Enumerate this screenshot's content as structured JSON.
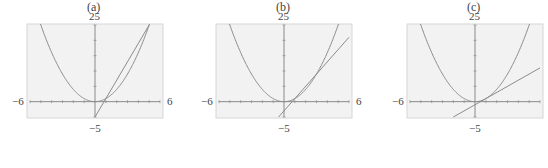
{
  "chart_data": [
    {
      "type": "line",
      "caption": "(a)",
      "xlim": [
        -6,
        6
      ],
      "ylim": [
        -5,
        25
      ],
      "tick_labels": {
        "x_min": "−6",
        "x_max": "6",
        "y_max": "25",
        "y_min": "−5"
      },
      "x_ticks_step": 1,
      "y_ticks_step": 5,
      "series": [
        {
          "name": "curve",
          "expr": "y = x^2"
        },
        {
          "name": "secant line",
          "expr": "y = 6x − 5",
          "points": [
            [
              0,
              -5
            ],
            [
              5,
              25
            ]
          ]
        }
      ],
      "grid": false,
      "background": "#f2f2f2"
    },
    {
      "type": "line",
      "caption": "(b)",
      "xlim": [
        -6,
        6
      ],
      "ylim": [
        -5,
        25
      ],
      "tick_labels": {
        "x_min": "−6",
        "x_max": "6",
        "y_max": "25",
        "y_min": "−5"
      },
      "x_ticks_step": 1,
      "y_ticks_step": 5,
      "series": [
        {
          "name": "curve",
          "expr": "y = x^2"
        },
        {
          "name": "secant line",
          "expr": "y = 4x − 3",
          "points": [
            [
              -0.5,
              -5
            ],
            [
              6,
              21
            ]
          ]
        }
      ],
      "grid": false,
      "background": "#f2f2f2"
    },
    {
      "type": "line",
      "caption": "(c)",
      "xlim": [
        -6,
        6
      ],
      "ylim": [
        -5,
        25
      ],
      "tick_labels": {
        "x_min": "−6",
        "x_max": "6",
        "y_max": "25",
        "y_min": "−5"
      },
      "x_ticks_step": 1,
      "y_ticks_step": 5,
      "series": [
        {
          "name": "curve",
          "expr": "y = x^2"
        },
        {
          "name": "tangent line",
          "expr": "y = 2x − 1",
          "points": [
            [
              -2,
              -5
            ],
            [
              6,
              11
            ]
          ]
        }
      ],
      "grid": false,
      "background": "#f2f2f2"
    }
  ],
  "panels": [
    {
      "caption": "(a)",
      "left_offset": 0,
      "frame": [
        27,
        24,
        136,
        94
      ],
      "show_right_label": true
    },
    {
      "caption": "(b)",
      "left_offset": 189,
      "frame": [
        27,
        24,
        136,
        94
      ],
      "show_right_label": true
    },
    {
      "caption": "(c)",
      "left_offset": 380,
      "frame": [
        27,
        24,
        136,
        94
      ],
      "show_right_label": false
    }
  ],
  "colors": {
    "frame_bg": "#f2f2f2",
    "frame_border": "#d6d6d6",
    "axis": "#8a8a8a",
    "curve": "#8c8c8c"
  }
}
